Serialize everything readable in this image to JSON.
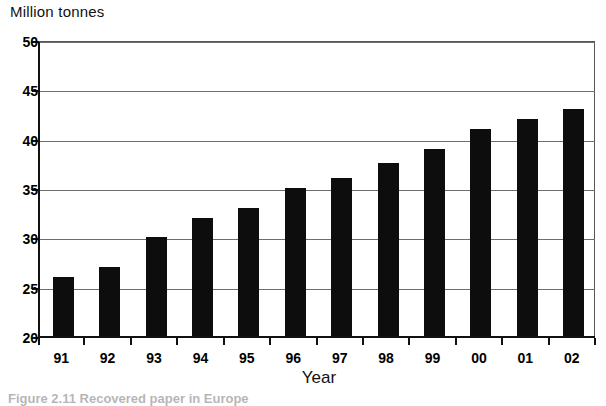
{
  "chart_data": {
    "type": "bar",
    "title": "",
    "ylabel": "Million tonnes",
    "xlabel": "Year",
    "categories": [
      "91",
      "92",
      "93",
      "94",
      "95",
      "96",
      "97",
      "98",
      "99",
      "00",
      "01",
      "02"
    ],
    "values": [
      26,
      27,
      30,
      32,
      33,
      35,
      36,
      37.5,
      39,
      41,
      42,
      43
    ],
    "ylim": [
      20,
      50
    ],
    "yticks": [
      20,
      25,
      30,
      35,
      40,
      45,
      50
    ],
    "ytick_labels": [
      "20",
      "25",
      "30",
      "35",
      "40",
      "45",
      "50"
    ],
    "grid": true,
    "grid_axis": "y",
    "legend": false,
    "legend_position": "none",
    "bar_color": "#0d0d0d",
    "series": [
      {
        "name": "Recovered paper",
        "values": [
          26,
          27,
          30,
          32,
          33,
          35,
          36,
          37.5,
          39,
          41,
          42,
          43
        ]
      }
    ]
  },
  "axes": {
    "y_unit_title": "Million tonnes",
    "x_axis_title": "Year"
  },
  "caption": {
    "text": "Figure 2.11 Recovered paper in Europe"
  },
  "colors": {
    "bar": "#0d0d0d",
    "gridline": "#6d6d6d",
    "axis": "#111111",
    "background": "#ffffff",
    "text": "#000000"
  }
}
